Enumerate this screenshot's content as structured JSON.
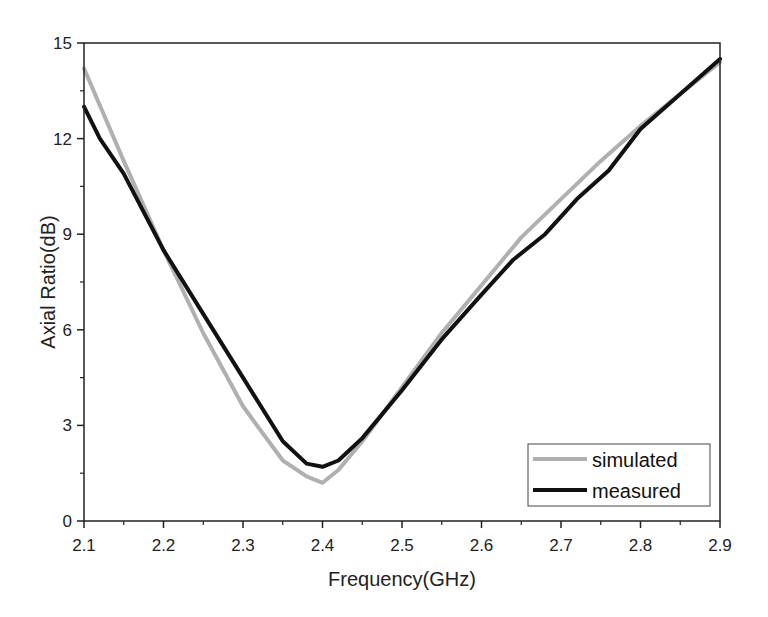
{
  "chart_data": {
    "type": "line",
    "title": "",
    "xlabel": "Frequency(GHz)",
    "ylabel": "Axial Ratio(dB)",
    "xlim": [
      2.1,
      2.9
    ],
    "ylim": [
      0,
      15
    ],
    "xticks": [
      "2.1",
      "2.2",
      "2.3",
      "2.4",
      "2.5",
      "2.6",
      "2.7",
      "2.8",
      "2.9"
    ],
    "yticks": [
      "0",
      "3",
      "6",
      "9",
      "12",
      "15"
    ],
    "grid": false,
    "legend_position": "lower right",
    "series": [
      {
        "name": "simulated",
        "color": "#b0b0b0",
        "x": [
          2.1,
          2.15,
          2.2,
          2.25,
          2.3,
          2.35,
          2.38,
          2.4,
          2.42,
          2.45,
          2.5,
          2.55,
          2.6,
          2.65,
          2.7,
          2.75,
          2.8,
          2.85,
          2.9
        ],
        "values": [
          14.2,
          11.3,
          8.5,
          5.9,
          3.6,
          1.9,
          1.4,
          1.2,
          1.6,
          2.5,
          4.2,
          5.9,
          7.4,
          8.9,
          10.1,
          11.3,
          12.4,
          13.4,
          14.4
        ]
      },
      {
        "name": "measured",
        "color": "#111111",
        "x": [
          2.1,
          2.12,
          2.15,
          2.2,
          2.25,
          2.3,
          2.35,
          2.38,
          2.4,
          2.42,
          2.45,
          2.5,
          2.55,
          2.6,
          2.64,
          2.68,
          2.72,
          2.76,
          2.8,
          2.85,
          2.9
        ],
        "values": [
          13.0,
          12.0,
          10.9,
          8.5,
          6.5,
          4.5,
          2.5,
          1.8,
          1.7,
          1.9,
          2.6,
          4.1,
          5.7,
          7.1,
          8.2,
          9.0,
          10.1,
          11.0,
          12.3,
          13.4,
          14.5
        ]
      }
    ]
  }
}
